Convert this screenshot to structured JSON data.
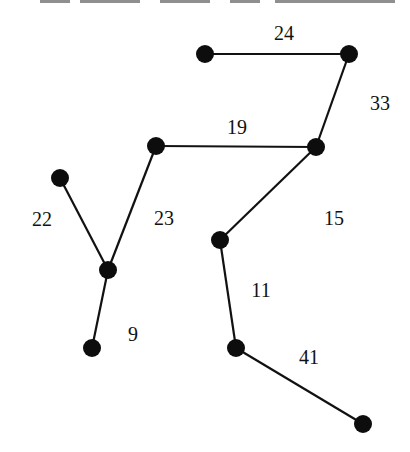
{
  "diagram": {
    "type": "weighted-tree",
    "nodes": [
      {
        "id": "A",
        "x": 205,
        "y": 54
      },
      {
        "id": "B",
        "x": 349,
        "y": 54
      },
      {
        "id": "C",
        "x": 316,
        "y": 147
      },
      {
        "id": "D",
        "x": 156,
        "y": 146
      },
      {
        "id": "E",
        "x": 60,
        "y": 178
      },
      {
        "id": "F",
        "x": 108,
        "y": 270
      },
      {
        "id": "G",
        "x": 92,
        "y": 348
      },
      {
        "id": "H",
        "x": 220,
        "y": 240
      },
      {
        "id": "I",
        "x": 236,
        "y": 348
      },
      {
        "id": "J",
        "x": 363,
        "y": 424
      }
    ],
    "edges": [
      {
        "from": "A",
        "to": "B",
        "weight": "24",
        "label_x": 284,
        "label_y": 33
      },
      {
        "from": "B",
        "to": "C",
        "weight": "33",
        "label_x": 380,
        "label_y": 103
      },
      {
        "from": "D",
        "to": "C",
        "weight": "19",
        "label_x": 237,
        "label_y": 127
      },
      {
        "from": "E",
        "to": "F",
        "weight": "22",
        "label_x": 42,
        "label_y": 219
      },
      {
        "from": "D",
        "to": "F",
        "weight": "23",
        "label_x": 164,
        "label_y": 218
      },
      {
        "from": "F",
        "to": "G",
        "weight": "9",
        "label_x": 133,
        "label_y": 334
      },
      {
        "from": "C",
        "to": "H",
        "weight": "15",
        "label_x": 334,
        "label_y": 218
      },
      {
        "from": "H",
        "to": "I",
        "weight": "11",
        "label_x": 261,
        "label_y": 290
      },
      {
        "from": "I",
        "to": "J",
        "weight": "41",
        "label_x": 309,
        "label_y": 357
      }
    ]
  }
}
